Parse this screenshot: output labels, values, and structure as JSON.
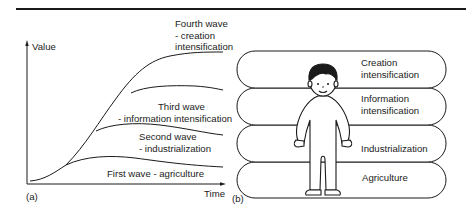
{
  "figure": {
    "panel_a_label": "(a)",
    "panel_b_label": "(b)"
  },
  "panel_a": {
    "y_axis_label": "Value",
    "x_axis_label": "Time",
    "curves": [
      {
        "line1": "Fourth wave",
        "line2": "- creation",
        "line3": "intensification"
      },
      {
        "line1": "Third wave",
        "line2": "- information intensification"
      },
      {
        "line1": "Second wave",
        "line2": "- industrialization"
      },
      {
        "line1": "First wave - agriculture"
      }
    ]
  },
  "panel_b": {
    "layers": [
      {
        "line1": "Creation",
        "line2": "intensification"
      },
      {
        "line1": "Information",
        "line2": "intensification"
      },
      {
        "line1": "Industrialization"
      },
      {
        "line1": "Agriculture"
      }
    ],
    "figure_icon": "person-icon"
  },
  "colors": {
    "ink": "#1a1a1a",
    "background": "#ffffff"
  }
}
